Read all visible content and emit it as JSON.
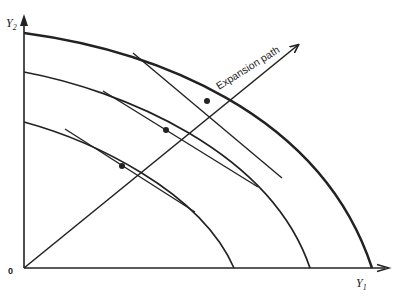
{
  "diagram": {
    "type": "production-possibility-frontiers",
    "axes": {
      "y_label": "Y",
      "y_subscript": "2",
      "x_label": "Y",
      "x_subscript": "1",
      "origin_label": "0"
    },
    "annotation": {
      "expansion_path_label": "Expansion path"
    },
    "curves": [
      {
        "name": "inner-frontier",
        "y_intercept": 122,
        "x_intercept": 234
      },
      {
        "name": "middle-frontier",
        "y_intercept": 72,
        "x_intercept": 310
      },
      {
        "name": "outer-frontier",
        "y_intercept": 33,
        "x_intercept": 372
      }
    ],
    "tangency_points": [
      {
        "x": 122,
        "y": 166
      },
      {
        "x": 166,
        "y": 130
      },
      {
        "x": 207,
        "y": 101
      }
    ],
    "colors": {
      "ink": "#222222",
      "background": "#ffffff"
    }
  }
}
